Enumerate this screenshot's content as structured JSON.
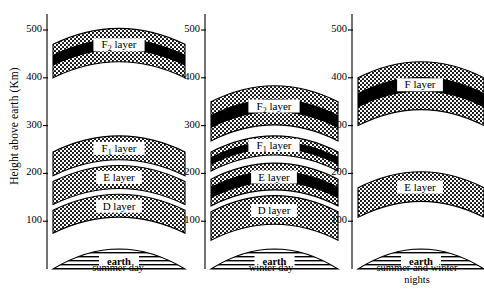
{
  "figure": {
    "axis_title": "Height above earth (Km)",
    "y_ticks": [
      100,
      200,
      300,
      400,
      500
    ],
    "y_unit": "Km",
    "earth_label": "earth",
    "colors": {
      "stipple": "#000000",
      "core": "#000000",
      "background": "#ffffff",
      "outline": "#000000"
    }
  },
  "chart_data": {
    "type": "area",
    "xlabel": "",
    "ylabel": "Height above earth (Km)",
    "ylim": [
      0,
      520
    ],
    "yticks": [
      100,
      200,
      300,
      400,
      500
    ],
    "grid": false,
    "legend": "none",
    "categories": [
      "summer day",
      "winter day",
      "summer and winter nights"
    ],
    "panels": [
      {
        "caption": "summer day",
        "layers": [
          {
            "name": "F_2 layer",
            "label_main": "F",
            "label_sub": "2",
            "label_tail": " layer",
            "bottom": 400,
            "top": 470,
            "core_bottom": 425,
            "core_top": 448,
            "has_core": true
          },
          {
            "name": "F_1 layer",
            "label_main": "F",
            "label_sub": "1",
            "label_tail": " layer",
            "bottom": 195,
            "top": 245,
            "core_bottom": 0,
            "core_top": 0,
            "has_core": false
          },
          {
            "name": "E layer",
            "label_main": "E",
            "label_sub": "",
            "label_tail": " layer",
            "bottom": 135,
            "top": 183,
            "core_bottom": 0,
            "core_top": 0,
            "has_core": false
          },
          {
            "name": "D layer",
            "label_main": "D",
            "label_sub": "",
            "label_tail": " layer",
            "bottom": 75,
            "top": 123,
            "core_bottom": 0,
            "core_top": 0,
            "has_core": false
          }
        ]
      },
      {
        "caption": "winter day",
        "layers": [
          {
            "name": "F_2 layer",
            "label_main": "F",
            "label_sub": "2",
            "label_tail": " layer",
            "bottom": 268,
            "top": 350,
            "core_bottom": 295,
            "core_top": 322,
            "has_core": true
          },
          {
            "name": "F_1 layer",
            "label_main": "F",
            "label_sub": "1",
            "label_tail": " layer",
            "bottom": 205,
            "top": 245,
            "core_bottom": 218,
            "core_top": 234,
            "has_core": true
          },
          {
            "name": "E layer",
            "label_main": "E",
            "label_sub": "",
            "label_tail": " layer",
            "bottom": 132,
            "top": 188,
            "core_bottom": 148,
            "core_top": 172,
            "has_core": true
          },
          {
            "name": "D layer",
            "label_main": "D",
            "label_sub": "",
            "label_tail": " layer",
            "bottom": 60,
            "top": 120,
            "core_bottom": 0,
            "core_top": 0,
            "has_core": false
          }
        ]
      },
      {
        "caption": "summer and winter\nnights",
        "layers": [
          {
            "name": "F layer",
            "label_main": "F",
            "label_sub": "",
            "label_tail": " layer",
            "bottom": 300,
            "top": 400,
            "core_bottom": 338,
            "core_top": 368,
            "has_core": true
          },
          {
            "name": "E layer",
            "label_main": "E",
            "label_sub": "",
            "label_tail": " layer",
            "bottom": 108,
            "top": 170,
            "core_bottom": 0,
            "core_top": 0,
            "has_core": false
          }
        ]
      }
    ]
  }
}
